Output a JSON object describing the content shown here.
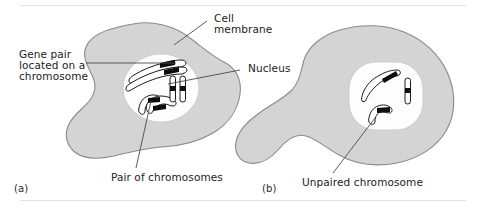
{
  "figure": {
    "colors": {
      "cytoplasm_fill": "#d4d4d4",
      "cytoplasm_stroke": "#8a8a8a",
      "nucleus_fill": "#fdfdfd",
      "nucleus_stroke": "#c9c9c9",
      "chromosome_stroke": "#1a1a1a",
      "chromosome_fill": "#ffffff",
      "marker_fill": "#0d0d0d",
      "leader_line": "#4a4a4a",
      "rule": "#e2e3e6",
      "text": "#1c1c1c",
      "background": "#ffffff"
    }
  },
  "labels": {
    "cell_membrane": "Cell\nmembrane",
    "cell_membrane_line1": "Cell",
    "cell_membrane_line2": "membrane",
    "nucleus": "Nucleus",
    "gene_pair_line1": "Gene pair",
    "gene_pair_line2": "located on a",
    "gene_pair_line3": "chromosome",
    "pair_of_chromosomes": "Pair of chromosomes",
    "unpaired_chromosome": "Unpaired chromosome"
  },
  "panels": [
    {
      "id": "a",
      "caption": "(a)",
      "description": "Cell containing paired chromosomes",
      "nucleus_contents": [
        "gene-pair-chromosome-upper",
        "gene-pair-chromosome-lower",
        "paired-chromosome-left",
        "paired-chromosome-right"
      ]
    },
    {
      "id": "b",
      "caption": "(b)",
      "description": "Cell containing an unpaired chromosome",
      "nucleus_contents": [
        "long-curved-chromosome",
        "vertical-rod-chromosome",
        "unpaired-hooked-chromosome"
      ]
    }
  ]
}
